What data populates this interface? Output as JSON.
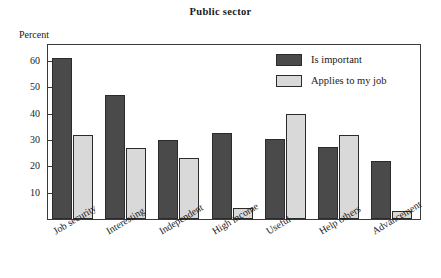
{
  "chart_data": {
    "type": "bar",
    "title": "Public sector",
    "xlabel": "",
    "ylabel": "Percent",
    "ylim": [
      0,
      66
    ],
    "yticks": [
      10,
      20,
      30,
      40,
      50,
      60
    ],
    "grid": false,
    "legend_position": "top-right",
    "categories": [
      "Job security",
      "Interesting",
      "Independent",
      "High income",
      "Useful",
      "Help others",
      "Advancement"
    ],
    "series": [
      {
        "name": "Is important",
        "color": "#4a4a4a",
        "values": [
          61,
          47,
          30,
          32.5,
          30.5,
          27.5,
          22
        ]
      },
      {
        "name": "Applies to my job",
        "color": "#d9d9d9",
        "values": [
          32,
          27,
          23,
          4,
          40,
          32,
          3
        ]
      }
    ]
  },
  "axis": {
    "y_title": "Percent"
  },
  "legend": {
    "items": [
      {
        "label": "Is important"
      },
      {
        "label": "Applies to my job"
      }
    ]
  },
  "colors": {
    "series_important": "#4a4a4a",
    "series_applies": "#d9d9d9",
    "frame": "#3a3a3a",
    "text": "#1a1a1a",
    "background": "#ffffff"
  }
}
